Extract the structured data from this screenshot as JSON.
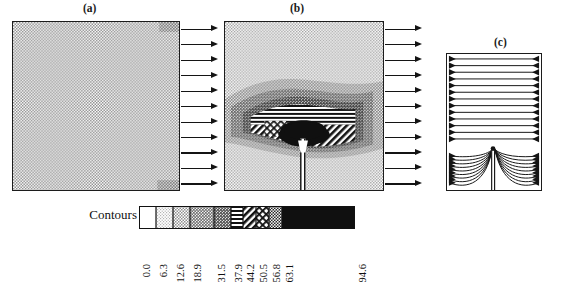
{
  "figure": {
    "panels": [
      {
        "id": "a",
        "label": "(a)",
        "description": "uniform light stipple field with outflow arrows on right edge",
        "arrow_count": 11
      },
      {
        "id": "b",
        "label": "(b)",
        "description": "contour band field with dark core, hatched bands and bottom crack, outflow arrows on right edge",
        "arrow_count": 11
      },
      {
        "id": "c",
        "label": "(c)",
        "description": "flux streamlines with arrowheads on both vertical edges converging at crack tip"
      }
    ]
  },
  "legend": {
    "title": "Contours",
    "levels": [
      "0.0",
      "6.3",
      "12.6",
      "18.9",
      "31.5",
      "37.9",
      "44.2",
      "50.5",
      "56.8",
      "63.1",
      "94.6"
    ],
    "level_values": [
      0.0,
      6.3,
      12.6,
      18.9,
      31.5,
      37.9,
      44.2,
      50.5,
      56.8,
      63.1,
      94.6
    ],
    "bands": [
      {
        "from": "0.0",
        "to": "6.3",
        "pattern": "white"
      },
      {
        "from": "6.3",
        "to": "12.6",
        "pattern": "stipple-1"
      },
      {
        "from": "12.6",
        "to": "18.9",
        "pattern": "stipple-2"
      },
      {
        "from": "18.9",
        "to": "31.5",
        "pattern": "stipple-3"
      },
      {
        "from": "31.5",
        "to": "37.9",
        "pattern": "stipple-4"
      },
      {
        "from": "37.9",
        "to": "44.2",
        "pattern": "horizontal-lines"
      },
      {
        "from": "44.2",
        "to": "50.5",
        "pattern": "diagonal-hatch"
      },
      {
        "from": "50.5",
        "to": "56.8",
        "pattern": "crosshatch"
      },
      {
        "from": "56.8",
        "to": "63.1",
        "pattern": "dense-stipple"
      },
      {
        "from": "63.1",
        "to": "94.6",
        "pattern": "solid-black"
      }
    ]
  },
  "chart_data": {
    "type": "heatmap",
    "title": "",
    "xlabel": "",
    "ylabel": "",
    "panels": [
      "(a)",
      "(b)",
      "(c)"
    ],
    "contour_levels": [
      0.0,
      6.3,
      12.6,
      18.9,
      31.5,
      37.9,
      44.2,
      50.5,
      56.8,
      63.1,
      94.6
    ],
    "legend_title": "Contours",
    "legend_position": "bottom",
    "grid": false
  },
  "colors": {
    "ink": "#141414",
    "band_white": "#ffffff",
    "band_light": "#e3e3e3",
    "band_mid": "#c9c9c9",
    "band_dark": "#9a9a9a",
    "band_black": "#121212"
  }
}
